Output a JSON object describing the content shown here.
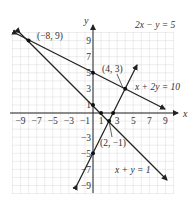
{
  "chart_data": {
    "type": "line",
    "title": "",
    "xlabel": "x",
    "ylabel": "y",
    "xlim": [
      -10,
      10
    ],
    "ylim": [
      -10,
      10
    ],
    "grid": true,
    "x_ticks": [
      "-9",
      "-7",
      "-5",
      "-3",
      "-1",
      "1",
      "3",
      "5",
      "7",
      "9"
    ],
    "y_ticks": [
      "9",
      "7",
      "5",
      "3",
      "1",
      "-3",
      "-5",
      "-7",
      "-9"
    ],
    "series": [
      {
        "name": "2x − y = 5",
        "equation": "2x - y = 5",
        "x": [
          -2,
          5.5
        ],
        "y": [
          -9,
          6
        ]
      },
      {
        "name": "x + 2y = 10",
        "equation": "x + 2y = 10",
        "x": [
          -9.5,
          9
        ],
        "y": [
          9.75,
          0.5
        ]
      },
      {
        "name": "x + y = 1",
        "equation": "x + y = 1",
        "x": [
          -9.5,
          10
        ],
        "y": [
          10.5,
          -9
        ]
      }
    ],
    "annotations": [
      {
        "text": "(−8, 9)",
        "x": -8,
        "y": 9
      },
      {
        "text": "(4, 3)",
        "x": 4,
        "y": 3
      },
      {
        "text": "(2, −1)",
        "x": 2,
        "y": -1
      }
    ],
    "points": [
      {
        "x": -8,
        "y": 9
      },
      {
        "x": 4,
        "y": 3
      },
      {
        "x": 2,
        "y": -1
      },
      {
        "x": 0,
        "y": 5
      },
      {
        "x": 0,
        "y": 1
      },
      {
        "x": 1,
        "y": 0
      },
      {
        "x": 2.5,
        "y": 0
      },
      {
        "x": 0,
        "y": -5
      }
    ]
  },
  "labels": {
    "x_axis": "x",
    "y_axis": "y",
    "eq1": "2x − y = 5",
    "eq2": "x + 2y = 10",
    "eq3": "x + y = 1",
    "pt1": "(−8, 9)",
    "pt2": "(4, 3)",
    "pt3": "(2, −1)",
    "xt": [
      "−9",
      "−7",
      "−5",
      "−3",
      "−1",
      "1",
      "3",
      "5",
      "7",
      "9"
    ],
    "yt": [
      "9",
      "7",
      "5",
      "3",
      "1",
      "−3",
      "−5",
      "−7",
      "−9"
    ]
  }
}
